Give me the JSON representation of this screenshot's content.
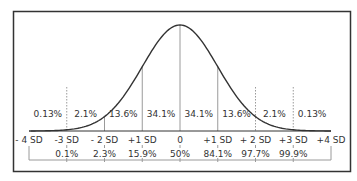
{
  "chart_data": {
    "type": "line",
    "title": "",
    "subtitle": "",
    "xlabel": "",
    "ylabel": "",
    "x": [
      -4,
      -3,
      -2,
      -1,
      0,
      1,
      2,
      3,
      4
    ],
    "sd_labels": [
      "- 4 SD",
      "-3 SD",
      "- 2 SD",
      "+1 SD",
      "0",
      "+1 SD",
      "+ 2 SD",
      "+3 SD",
      "+4 SD"
    ],
    "region_percentages": {
      "labels": [
        "0.13%",
        "2.1%",
        "13.6%",
        "34.1%",
        "34.1%",
        "13.6%",
        "2.1%",
        "0.13%"
      ],
      "values": [
        0.13,
        2.1,
        13.6,
        34.1,
        34.1,
        13.6,
        2.1,
        0.13
      ],
      "between": [
        [
          -4,
          -3
        ],
        [
          -3,
          -2
        ],
        [
          -2,
          -1
        ],
        [
          -1,
          0
        ],
        [
          0,
          1
        ],
        [
          1,
          2
        ],
        [
          2,
          3
        ],
        [
          3,
          4
        ]
      ]
    },
    "cumulative_percentiles": {
      "x": [
        -3,
        -2,
        -1,
        0,
        1,
        2,
        3
      ],
      "labels": [
        "0.1%",
        "2.3%",
        "15.9%",
        "50%",
        "84.1%",
        "97.7%",
        "99.9%"
      ],
      "values": [
        0.1,
        2.3,
        15.9,
        50,
        84.1,
        97.7,
        99.9
      ]
    },
    "divider_styles": {
      "-3": "dotted",
      "-2": "solid",
      "-1": "solid",
      "0": "solid",
      "1": "solid",
      "2": "dotted",
      "3": "dotted"
    },
    "xlim": [
      -4,
      4
    ],
    "grid": false,
    "legend": "none"
  },
  "colors": {
    "curve": "#333333",
    "frame": "#333333",
    "divider": "#9a9a9a",
    "text": "#333333",
    "background": "#ffffff"
  }
}
